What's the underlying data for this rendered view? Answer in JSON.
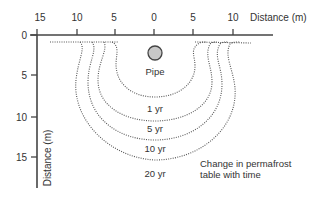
{
  "diagram": {
    "x_axis": {
      "label": "Distance (m)",
      "ticks": [
        "15",
        "10",
        "5",
        "0",
        "5",
        "10"
      ]
    },
    "y_axis": {
      "label": "Distance (m)",
      "ticks": [
        "0",
        "5",
        "10",
        "15"
      ]
    },
    "pipe": {
      "label": "Pipe",
      "color": "#c8c8c8"
    },
    "contours": [
      {
        "label": "1 yr"
      },
      {
        "label": "5 yr"
      },
      {
        "label": "10 yr"
      },
      {
        "label": "20 yr"
      }
    ],
    "caption": {
      "line1": "Change in permafrost",
      "line2": "table with time"
    }
  }
}
